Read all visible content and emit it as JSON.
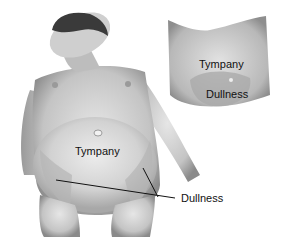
{
  "figure": {
    "main": {
      "labels": {
        "tympany": "Tympany",
        "dullness": "Dullness"
      }
    },
    "inset": {
      "labels": {
        "tympany": "Tympany",
        "dullness": "Dullness"
      }
    }
  }
}
